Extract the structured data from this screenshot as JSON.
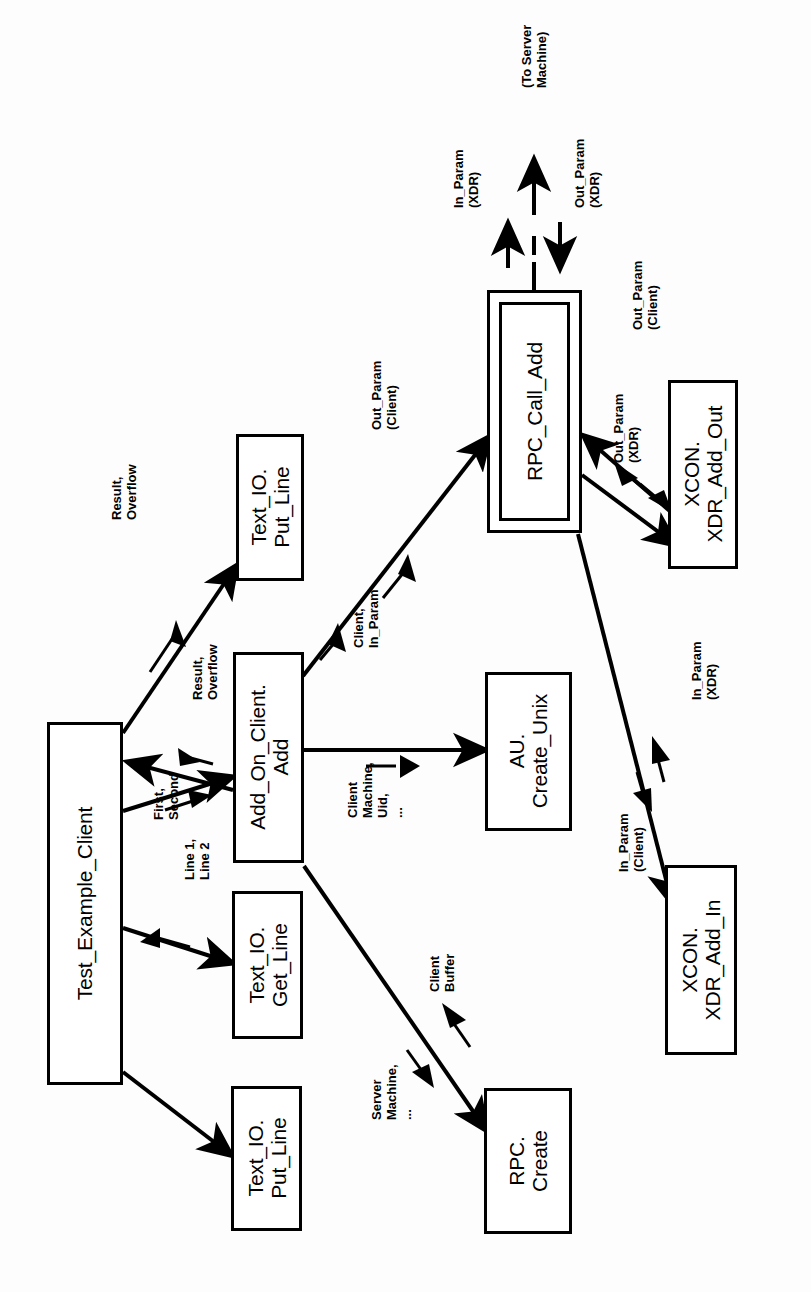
{
  "diagram": {
    "orientation": "rotated-90-ccw",
    "background_color": "#fdfdfd",
    "line_color": "#000000",
    "nodes": [
      {
        "id": "test_example_client",
        "label": "Test_Example_Client",
        "x": 47,
        "y": 722,
        "w": 76,
        "h": 363,
        "nested": false
      },
      {
        "id": "text_io_put_line_top",
        "label": "Text_IO.\nPut_Line",
        "x": 236,
        "y": 434,
        "w": 68,
        "h": 147,
        "nested": false
      },
      {
        "id": "add_on_client_add",
        "label": "Add_On_Client.\nAdd",
        "x": 233,
        "y": 652,
        "w": 71,
        "h": 211,
        "nested": false
      },
      {
        "id": "text_io_get_line",
        "label": "Text_IO.\nGet_Line",
        "x": 232,
        "y": 891,
        "w": 71,
        "h": 148,
        "nested": false
      },
      {
        "id": "text_io_put_line_bottom",
        "label": "Text_IO.\nPut_Line",
        "x": 231,
        "y": 1086,
        "w": 71,
        "h": 145,
        "nested": false
      },
      {
        "id": "rpc_call_add",
        "label": "RPC_Call_Add",
        "x": 487,
        "y": 290,
        "w": 95,
        "h": 243,
        "nested": true
      },
      {
        "id": "au_create_unix",
        "label": "AU.\nCreate_Unix",
        "x": 485,
        "y": 672,
        "w": 87,
        "h": 159,
        "nested": false
      },
      {
        "id": "rpc_create",
        "label": "RPC.\nCreate",
        "x": 484,
        "y": 1088,
        "w": 88,
        "h": 146,
        "nested": false
      },
      {
        "id": "xcon_xdr_add_out",
        "label": "XCON.\nXDR_Add_Out",
        "x": 668,
        "y": 380,
        "w": 70,
        "h": 189,
        "nested": false
      },
      {
        "id": "xcon_xdr_add_in",
        "label": "XCON.\nXDR_Add_In",
        "x": 665,
        "y": 865,
        "w": 72,
        "h": 190,
        "nested": false
      }
    ],
    "edge_labels": [
      {
        "id": "to_server_machine",
        "text": "(To Server\nMachine)",
        "x": 520,
        "y": 88
      },
      {
        "id": "in_param_xdr_top",
        "text": "In_Param\n(XDR)",
        "x": 452,
        "y": 208
      },
      {
        "id": "out_param_xdr_top",
        "text": "Out_Param\n(XDR)",
        "x": 573,
        "y": 208
      },
      {
        "id": "out_param_client_xdradd",
        "text": "Out_Param\n(Client)",
        "x": 631,
        "y": 330
      },
      {
        "id": "out_param_xdr_bottom",
        "text": "Out_Param\n(XDR)",
        "x": 612,
        "y": 463
      },
      {
        "id": "out_param_client_rpccall",
        "text": "Out_Param\n(Client)",
        "x": 370,
        "y": 430
      },
      {
        "id": "result_overflow_putline",
        "text": "Result,\nOverflow",
        "x": 110,
        "y": 520
      },
      {
        "id": "client_in_param",
        "text": "Client,\nIn_Param",
        "x": 352,
        "y": 648
      },
      {
        "id": "result_overflow_add",
        "text": "Result,\nOverflow",
        "x": 191,
        "y": 700
      },
      {
        "id": "first_second",
        "text": "First,\nSecond",
        "x": 152,
        "y": 820
      },
      {
        "id": "line1_line2",
        "text": "Line 1,\nLine 2",
        "x": 183,
        "y": 880
      },
      {
        "id": "client_machine_uid",
        "text": "Client\nMachine,\nUid,\n...",
        "x": 346,
        "y": 818
      },
      {
        "id": "in_param_xdr_bottom",
        "text": "In_Param\n(XDR)",
        "x": 690,
        "y": 700
      },
      {
        "id": "in_param_client",
        "text": "In_Param\n(Client)",
        "x": 617,
        "y": 872
      },
      {
        "id": "client_buffer",
        "text": "Client\nBuffer",
        "x": 428,
        "y": 992
      },
      {
        "id": "server_machine",
        "text": "Server\nMachine,\n...",
        "x": 370,
        "y": 1120
      }
    ],
    "edges": [
      {
        "id": "tec-to-putline-top",
        "from": "test_example_client",
        "to": "text_io_put_line_top",
        "label": "Result, Overflow"
      },
      {
        "id": "tec-to-add-result",
        "from": "add_on_client_add",
        "to": "test_example_client",
        "label": "Result, Overflow"
      },
      {
        "id": "tec-to-add-first",
        "from": "test_example_client",
        "to": "add_on_client_add",
        "label": "First, Second"
      },
      {
        "id": "tec-to-getline",
        "from": "test_example_client",
        "to": "text_io_get_line",
        "label": "Line 1, Line 2"
      },
      {
        "id": "tec-to-putline-bottom",
        "from": "test_example_client",
        "to": "text_io_put_line_bottom",
        "label": ""
      },
      {
        "id": "add-to-rpccall-in",
        "from": "add_on_client_add",
        "to": "rpc_call_add",
        "label": "Client, In_Param"
      },
      {
        "id": "rpccall-to-add-out",
        "from": "rpc_call_add",
        "to": "add_on_client_add",
        "label": "Out_Param (Client)"
      },
      {
        "id": "add-to-au",
        "from": "add_on_client_add",
        "to": "au_create_unix",
        "label": "Client Machine, Uid, ..."
      },
      {
        "id": "add-to-rpccreate",
        "from": "add_on_client_add",
        "to": "rpc_create",
        "label": "Server Machine, ..."
      },
      {
        "id": "rpccreate-to-add",
        "from": "rpc_create",
        "to": "add_on_client_add",
        "label": "Client Buffer"
      },
      {
        "id": "rpccall-to-xdrout",
        "from": "rpc_call_add",
        "to": "xcon_xdr_add_out",
        "label": "Out_Param (XDR)"
      },
      {
        "id": "xdrout-to-rpccall",
        "from": "xcon_xdr_add_out",
        "to": "rpc_call_add",
        "label": "Out_Param (Client)"
      },
      {
        "id": "rpccall-to-xdrin",
        "from": "rpc_call_add",
        "to": "xcon_xdr_add_in",
        "label": "In_Param (Client)"
      },
      {
        "id": "xdrin-to-rpccall",
        "from": "xcon_xdr_add_in",
        "to": "rpc_call_add",
        "label": "In_Param (XDR)"
      },
      {
        "id": "rpccall-to-server",
        "from": "rpc_call_add",
        "to": "server",
        "label": "(To Server Machine)"
      }
    ]
  }
}
